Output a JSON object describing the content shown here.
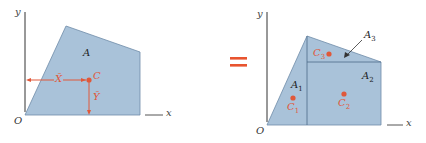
{
  "colors": {
    "fill": "#a9c2d9",
    "edge": "#5a7896",
    "axis": "#333333",
    "accent": "#e0583a",
    "label": "#222222",
    "equals": "#e8542f"
  },
  "left_figure": {
    "axis_y_label": "y",
    "axis_x_label": "x",
    "origin_label": "O",
    "area_label": "A",
    "centroid_label": "C",
    "xbar_label": "X̄",
    "ybar_label": "Ȳ"
  },
  "equals_sign": "=",
  "right_figure": {
    "axis_y_label": "y",
    "axis_x_label": "x",
    "origin_label": "O",
    "areas": [
      {
        "label": "A",
        "sub": "1"
      },
      {
        "label": "A",
        "sub": "2"
      },
      {
        "label": "A",
        "sub": "3"
      }
    ],
    "centroids": [
      {
        "label": "C",
        "sub": "1"
      },
      {
        "label": "C",
        "sub": "2"
      },
      {
        "label": "C",
        "sub": "3"
      }
    ]
  }
}
